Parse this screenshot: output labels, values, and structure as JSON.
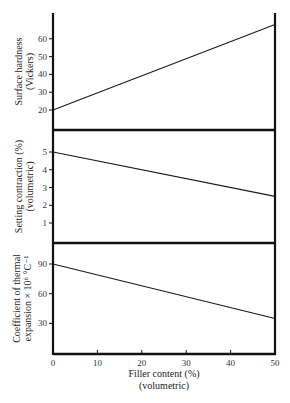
{
  "chart_data": [
    {
      "type": "line",
      "panel": "top",
      "ylabel_lines": [
        "Surface hardness",
        "(Vickers)"
      ],
      "yticks": [
        20,
        30,
        40,
        50,
        60
      ],
      "ylim": [
        10,
        75
      ],
      "x": [
        0,
        50
      ],
      "series": [
        {
          "name": "Surface hardness",
          "values": [
            20,
            68
          ]
        }
      ]
    },
    {
      "type": "line",
      "panel": "middle",
      "ylabel_lines": [
        "Setting contraction (%)",
        "(volumetric)"
      ],
      "yticks": [
        1,
        2,
        3,
        4,
        5
      ],
      "ylim": [
        0,
        6.2
      ],
      "x": [
        0,
        50
      ],
      "series": [
        {
          "name": "Setting contraction",
          "values": [
            5,
            2.5
          ]
        }
      ]
    },
    {
      "type": "line",
      "panel": "bottom",
      "ylabel_lines": [
        "Coefficient of thermal",
        "expansion × 10⁶ °C⁻¹"
      ],
      "yticks": [
        30,
        60,
        90
      ],
      "ylim": [
        0,
        110
      ],
      "x": [
        0,
        50
      ],
      "series": [
        {
          "name": "Coefficient of thermal expansion",
          "values": [
            90,
            35
          ]
        }
      ]
    }
  ],
  "xaxis": {
    "label_line1": "Filler content (%)",
    "label_line2": "(volumetric)",
    "ticks": [
      0,
      10,
      20,
      30,
      40,
      50
    ],
    "xlim": [
      0,
      50
    ]
  },
  "layout": {
    "x_left_px": 53,
    "x_right_px": 275,
    "panels": [
      {
        "top_px": 13,
        "bottom_px": 130,
        "v_ref": 20,
        "y_ref_px": 110,
        "px_per_unit": 1.78
      },
      {
        "top_px": 130,
        "bottom_px": 243,
        "v_ref": 5,
        "y_ref_px": 152,
        "px_per_unit": 17.75
      },
      {
        "top_px": 243,
        "bottom_px": 354,
        "v_ref": 90,
        "y_ref_px": 264,
        "px_per_unit": 0.99
      }
    ]
  },
  "colors": {
    "line": "#1a1a1a",
    "axis": "#111111",
    "background": "#ffffff"
  }
}
